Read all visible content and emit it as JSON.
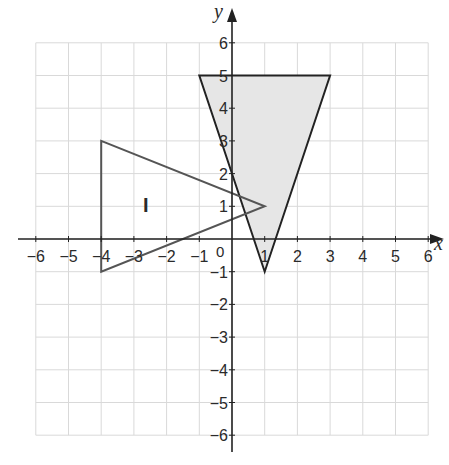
{
  "chart_data": {
    "type": "diagram",
    "title": "",
    "xlabel": "x",
    "ylabel": "y",
    "xlim": [
      -6,
      6
    ],
    "ylim": [
      -6,
      6
    ],
    "grid": true,
    "x_ticks": [
      "−6",
      "−5",
      "−4",
      "−3",
      "−2",
      "−1",
      "1",
      "2",
      "3",
      "4",
      "5",
      "6"
    ],
    "y_ticks": [
      "6",
      "5",
      "4",
      "3",
      "2",
      "1",
      "−1",
      "−2",
      "−3",
      "−4",
      "−5",
      "−6"
    ],
    "origin_label": "0",
    "shapes": [
      {
        "name": "triangle-I",
        "label": "I",
        "vertices": [
          [
            -4,
            3
          ],
          [
            1,
            1
          ],
          [
            -4,
            -1
          ]
        ],
        "fill": "none",
        "stroke": "#555555"
      },
      {
        "name": "shaded-triangle",
        "label": "",
        "vertices": [
          [
            -1,
            5
          ],
          [
            3,
            5
          ],
          [
            1,
            -1
          ]
        ],
        "fill": "#e6e6e6",
        "stroke": "#222222"
      }
    ]
  },
  "labels": {
    "x_axis": "x",
    "y_axis": "y",
    "origin": "0",
    "triangle_label": "I"
  },
  "colors": {
    "grid": "#d9d9d9",
    "axis": "#222222",
    "shaded_fill": "#e6e6e6",
    "triangle_I_stroke": "#555555",
    "shaded_stroke": "#222222"
  }
}
